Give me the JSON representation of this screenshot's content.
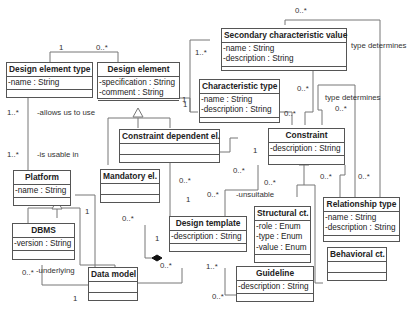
{
  "diagram": {
    "type": "UML class diagram",
    "classes": {
      "design_element_type": {
        "name": "Design element type",
        "attributes": [
          "-name : String"
        ]
      },
      "design_element": {
        "name": "Design element",
        "attributes": [
          "-specification : String",
          "-comment : String"
        ]
      },
      "secondary_characteristic_value": {
        "name": "Secondary characteristic value",
        "attributes": [
          "-name : String",
          "-description : String"
        ]
      },
      "characteristic_type": {
        "name": "Characteristic type",
        "attributes": [
          "-name : String",
          "-description : String"
        ]
      },
      "constraint_dependent_el": {
        "name": "Constraint dependent el.",
        "attributes": []
      },
      "constraint": {
        "name": "Constraint",
        "attributes": [
          "-description : String"
        ]
      },
      "platform": {
        "name": "Platform",
        "attributes": [
          "-name : String"
        ]
      },
      "mandatory_el": {
        "name": "Mandatory el.",
        "attributes": []
      },
      "design_template": {
        "name": "Design template",
        "attributes": [
          "-description : String"
        ]
      },
      "structural_ct": {
        "name": "Structural ct.",
        "attributes": [
          "-role : Enum",
          "-type : Enum",
          "-value : Enum"
        ]
      },
      "relationship_type": {
        "name": "Relationship type",
        "attributes": [
          "-name : String",
          "-description : String"
        ]
      },
      "dbms": {
        "name": "DBMS",
        "attributes": [
          "-version : String"
        ]
      },
      "data_model": {
        "name": "Data model",
        "attributes": []
      },
      "guideline": {
        "name": "Guideline",
        "attributes": [
          "-description : String"
        ]
      },
      "behavioral_ct": {
        "name": "Behavioral ct.",
        "attributes": []
      }
    },
    "labels": {
      "det_de_1": "1",
      "det_de_0n": "0..*",
      "det_allows_mult": "1..*",
      "allows_us_to_use": "-allows us to use",
      "platform_usable_mult": "1..*",
      "is_usable_in": "-is usable in",
      "de_1_right": "1",
      "scv_top_0n": "0..*",
      "scv_left_1n": "1..*",
      "ct_left_1": "1",
      "type_determines_1": "type determines",
      "type_determines_2": "type determines",
      "scv_constraint_0n": "0..*",
      "ct_constraint_0n": "0..*",
      "td_constraint_0n": "0..*",
      "cde_constraint_1": "1",
      "cde_constraint_0n": "0..*",
      "mandatory_0n": "0..*",
      "cde_dt_1": "1",
      "mandatory_dt_1": "1",
      "mandatory_left_0n": "0..*",
      "platform_1": "1",
      "constraint_unsuitable_0n": "0..*",
      "unsuitable": "-unsuitable",
      "dt_unsuitable_0n": "0..*",
      "rt_0n": "0..*",
      "rt_0n_b": "0..*",
      "dt_platform_0n": "0..*",
      "dt_guideline_1n": "1..*",
      "guideline_0n": "0..*",
      "dbms_0n": "0..*",
      "underlying": "-underlying",
      "datamodel_1": "1"
    }
  }
}
